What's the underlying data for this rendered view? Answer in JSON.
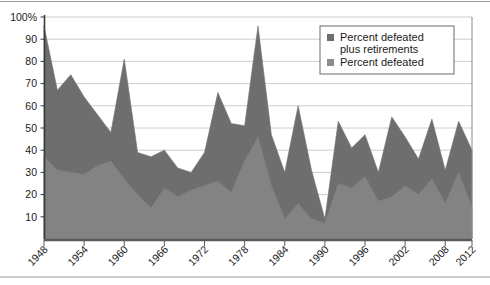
{
  "chart_data": {
    "type": "area",
    "stacked": true,
    "title": "",
    "subtitle": "",
    "xlabel": "",
    "ylabel": "",
    "ylim": [
      0,
      100
    ],
    "xlim": [
      1948,
      2012
    ],
    "grid": true,
    "grid_axis": "y",
    "legend_position": "top-right",
    "ytick_labels": [
      "100%",
      "90",
      "80",
      "70",
      "60",
      "50",
      "40",
      "30",
      "20",
      "10"
    ],
    "ytick_values": [
      100,
      90,
      80,
      70,
      60,
      50,
      40,
      30,
      20,
      10
    ],
    "xtick_labels": [
      "1948",
      "1954",
      "1960",
      "1966",
      "1972",
      "1978",
      "1984",
      "1990",
      "1996",
      "2002",
      "2008",
      "2012"
    ],
    "xtick_values": [
      1948,
      1954,
      1960,
      1966,
      1972,
      1978,
      1984,
      1990,
      1996,
      2002,
      2008,
      2012
    ],
    "x": [
      1948,
      1950,
      1952,
      1954,
      1956,
      1958,
      1960,
      1962,
      1964,
      1966,
      1968,
      1970,
      1972,
      1974,
      1976,
      1978,
      1980,
      1982,
      1984,
      1986,
      1988,
      1990,
      1992,
      1994,
      1996,
      1998,
      2000,
      2002,
      2004,
      2006,
      2008,
      2010,
      2012
    ],
    "series": [
      {
        "name": "Percent defeated",
        "color": "#838383",
        "values": [
          37,
          31,
          30,
          29,
          33,
          35,
          27,
          20,
          14,
          23,
          19,
          22,
          24,
          26,
          21,
          35,
          46,
          24,
          9,
          16,
          9,
          7,
          25,
          23,
          28,
          17,
          19,
          24,
          20,
          27,
          16,
          30,
          14
        ]
      },
      {
        "name": "Percent defeated plus retirements",
        "color": "#6e6e6e",
        "values": [
          96,
          67,
          74,
          64,
          56,
          48,
          81,
          39,
          37,
          40,
          32,
          30,
          39,
          66,
          52,
          51,
          96,
          47,
          30,
          60,
          31,
          9,
          53,
          41,
          47,
          30,
          55,
          46,
          36,
          54,
          31,
          53,
          40
        ]
      }
    ],
    "annotations": []
  },
  "legend": {
    "items": [
      {
        "label_line1": "Percent defeated",
        "label_line2": "plus retirements",
        "swatch_color": "#6e6e6e"
      },
      {
        "label_line1": "Percent defeated",
        "label_line2": "",
        "swatch_color": "#8d8d8d"
      }
    ]
  },
  "axes": {
    "y_axis_color": "#3a3a3a",
    "x_axis_color": "#5a5a5a",
    "gridline_color": "#c8c8c8",
    "plot_border_color": "#6e6e6e"
  },
  "frame": {
    "top_rule_color": "#9a9a9a",
    "bottom_rule_color": "#9a9a9a"
  }
}
